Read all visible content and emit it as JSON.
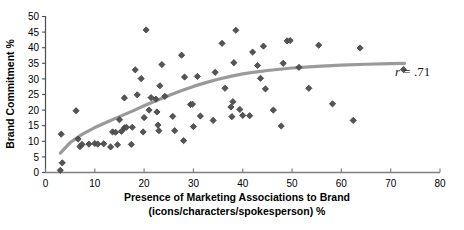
{
  "chart_data": {
    "type": "scatter",
    "title": "",
    "xlabel": "Presence of Marketing Associations to Brand (icons/characters/spokesperson) %",
    "xlabel_line1": "Presence of Marketing Associations to Brand",
    "xlabel_line2": "(icons/characters/spokesperson) %",
    "ylabel": "Brand Commitment %",
    "xlim": [
      0,
      80
    ],
    "ylim": [
      0,
      50
    ],
    "xticks": [
      0,
      10,
      20,
      30,
      40,
      50,
      60,
      70,
      80
    ],
    "xtick_labels": [
      "0",
      "10",
      "20",
      "30",
      "40",
      "50",
      "60",
      "70",
      "80"
    ],
    "yticks": [
      0,
      5,
      10,
      15,
      20,
      25,
      30,
      35,
      40,
      45,
      50
    ],
    "ytick_labels": [
      "0",
      "5",
      "10",
      "15",
      "20",
      "25",
      "30",
      "35",
      "40",
      "45",
      "50"
    ],
    "grid": false,
    "legend": false,
    "marker": "diamond",
    "marker_color": "#555555",
    "trendline_color": "#999999",
    "annotations": [
      {
        "name": "correlation",
        "text_italic": "r",
        "text": " = .71",
        "x": 62.5,
        "y": 22.5
      }
    ],
    "series": [
      {
        "name": "Brand data",
        "points": [
          [
            3.0,
            0.7
          ],
          [
            3.4,
            3.1
          ],
          [
            3.2,
            12.3
          ],
          [
            6.2,
            19.8
          ],
          [
            6.6,
            10.7
          ],
          [
            7.0,
            8.3
          ],
          [
            7.4,
            9.0
          ],
          [
            8.8,
            9.1
          ],
          [
            10.0,
            9.3
          ],
          [
            10.6,
            9.1
          ],
          [
            11.8,
            9.2
          ],
          [
            13.2,
            8.2
          ],
          [
            13.6,
            13.0
          ],
          [
            14.2,
            12.9
          ],
          [
            14.6,
            8.9
          ],
          [
            15.0,
            16.9
          ],
          [
            15.4,
            13.2
          ],
          [
            16.0,
            14.3
          ],
          [
            16.4,
            14.5
          ],
          [
            16.0,
            23.9
          ],
          [
            17.4,
            9.0
          ],
          [
            17.6,
            14.5
          ],
          [
            18.2,
            32.9
          ],
          [
            18.6,
            24.9
          ],
          [
            19.4,
            30.1
          ],
          [
            19.8,
            13.0
          ],
          [
            20.0,
            17.6
          ],
          [
            20.4,
            45.7
          ],
          [
            21.0,
            20.0
          ],
          [
            21.4,
            24.0
          ],
          [
            22.4,
            23.5
          ],
          [
            22.6,
            19.4
          ],
          [
            22.8,
            15.2
          ],
          [
            23.0,
            13.4
          ],
          [
            23.2,
            27.8
          ],
          [
            23.6,
            34.6
          ],
          [
            24.2,
            24.4
          ],
          [
            25.8,
            18.0
          ],
          [
            26.2,
            13.4
          ],
          [
            27.6,
            37.6
          ],
          [
            28.0,
            10.2
          ],
          [
            28.2,
            30.6
          ],
          [
            29.4,
            21.8
          ],
          [
            29.8,
            21.9
          ],
          [
            30.0,
            14.7
          ],
          [
            30.8,
            30.8
          ],
          [
            31.4,
            18.1
          ],
          [
            34.0,
            16.7
          ],
          [
            34.4,
            32.1
          ],
          [
            35.8,
            41.4
          ],
          [
            36.4,
            27.0
          ],
          [
            37.6,
            21.0
          ],
          [
            37.8,
            17.9
          ],
          [
            38.0,
            22.7
          ],
          [
            38.2,
            35.2
          ],
          [
            38.6,
            45.6
          ],
          [
            39.4,
            20.2
          ],
          [
            40.0,
            18.3
          ],
          [
            41.4,
            18.2
          ],
          [
            42.0,
            38.6
          ],
          [
            43.0,
            34.3
          ],
          [
            43.6,
            30.2
          ],
          [
            44.2,
            40.5
          ],
          [
            44.6,
            26.8
          ],
          [
            46.2,
            20.0
          ],
          [
            47.8,
            14.9
          ],
          [
            48.2,
            35.0
          ],
          [
            49.0,
            42.2
          ],
          [
            49.6,
            42.3
          ],
          [
            51.4,
            33.7
          ],
          [
            53.4,
            27.0
          ],
          [
            55.4,
            40.8
          ],
          [
            58.2,
            22.0
          ],
          [
            62.4,
            16.7
          ],
          [
            63.8,
            39.9
          ],
          [
            72.6,
            33.0
          ]
        ]
      }
    ],
    "trendline": {
      "name": "fitted-curve",
      "points": [
        [
          3.0,
          6.2
        ],
        [
          5.0,
          9.6
        ],
        [
          7.5,
          12.3
        ],
        [
          10.0,
          14.4
        ],
        [
          12.5,
          16.2
        ],
        [
          15.0,
          17.9
        ],
        [
          17.5,
          19.6
        ],
        [
          20.0,
          21.4
        ],
        [
          22.5,
          23.1
        ],
        [
          25.0,
          24.7
        ],
        [
          27.5,
          26.2
        ],
        [
          30.0,
          27.6
        ],
        [
          32.5,
          28.8
        ],
        [
          35.0,
          29.9
        ],
        [
          37.5,
          30.8
        ],
        [
          40.0,
          31.6
        ],
        [
          42.5,
          32.2
        ],
        [
          45.0,
          32.7
        ],
        [
          47.5,
          33.1
        ],
        [
          50.0,
          33.5
        ],
        [
          55.0,
          34.0
        ],
        [
          60.0,
          34.4
        ],
        [
          65.0,
          34.7
        ],
        [
          70.0,
          34.9
        ],
        [
          72.8,
          35.0
        ]
      ]
    }
  }
}
